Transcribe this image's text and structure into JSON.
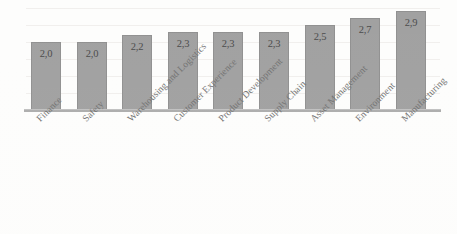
{
  "chart_data": {
    "type": "bar",
    "title": "",
    "subtitle": "",
    "xlabel": "",
    "ylabel": "",
    "ylim": [
      0,
      3.0
    ],
    "grid": true,
    "legend": "none",
    "decimal_separator": ",",
    "orientation": "vertical",
    "categories": [
      "Finance",
      "Safety",
      "Warehousing and Logistics",
      "Customer Experience",
      "Product Development",
      "Supply Chain",
      "Asset Management",
      "Environment",
      "Manufacturing"
    ],
    "values": [
      2.0,
      2.0,
      2.2,
      2.3,
      2.3,
      2.3,
      2.5,
      2.7,
      2.9
    ],
    "value_labels": [
      "2,0",
      "2,0",
      "2,2",
      "2,3",
      "2,3",
      "2,3",
      "2,5",
      "2,7",
      "2,9"
    ],
    "bar_color": "#9b9b9b",
    "bar_border_color": "#8a8a8a",
    "axis_color": "#a8a8a8",
    "gridline_color": "#f0eeec",
    "label_color": "#6a6a6a",
    "value_label_color": "#3f3f3f",
    "background_color": "#fdfdfc"
  }
}
